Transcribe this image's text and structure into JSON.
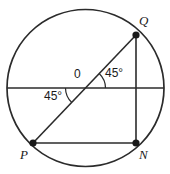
{
  "figure": {
    "type": "circle-geometry-diagram",
    "background_color": "#ffffff",
    "stroke_color": "#2b2b2b",
    "labels": {
      "center": "0",
      "vertex_q": "Q",
      "vertex_p": "P",
      "vertex_n": "N",
      "angle_right": "45°",
      "angle_left": "45°"
    },
    "geometry": {
      "circle": {
        "cx": 85.5,
        "cy": 88,
        "r": 78.5
      },
      "points": {
        "Q": {
          "x": 136,
          "y": 35
        },
        "P": {
          "x": 33,
          "y": 143
        },
        "N": {
          "x": 136,
          "y": 143
        },
        "O": {
          "x": 85.5,
          "y": 88
        }
      },
      "segments": [
        {
          "name": "horizontal-diameter",
          "x1": 7,
          "y1": 88,
          "x2": 164,
          "y2": 88
        },
        {
          "name": "diagonal-PQ",
          "x1": 33,
          "y1": 143,
          "x2": 136,
          "y2": 35
        },
        {
          "name": "chord-QN",
          "x1": 136,
          "y1": 35,
          "x2": 136,
          "y2": 143
        },
        {
          "name": "chord-PN",
          "x1": 33,
          "y1": 143,
          "x2": 136,
          "y2": 143
        }
      ],
      "angle_arcs": [
        {
          "name": "angle-arc-right",
          "cx": 85.5,
          "cy": 88,
          "r": 20,
          "from_deg": 0,
          "to_deg": 46
        },
        {
          "name": "angle-arc-left",
          "cx": 85.5,
          "cy": 88,
          "r": 20,
          "from_deg": 180,
          "to_deg": 226
        }
      ]
    }
  }
}
